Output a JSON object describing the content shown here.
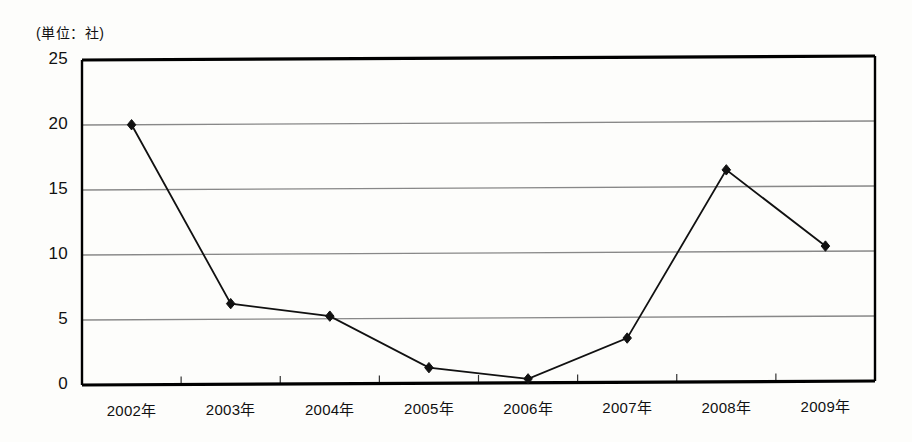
{
  "chart_data": {
    "type": "line",
    "title": "",
    "subtitle": "",
    "unit_label": "(単位：社)",
    "xlabel": "",
    "ylabel": "",
    "categories": [
      "2002年",
      "2003年",
      "2004年",
      "2005年",
      "2006年",
      "2007年",
      "2008年",
      "2009年"
    ],
    "values": [
      20.0,
      6.2,
      5.2,
      1.2,
      0.3,
      3.4,
      16.3,
      10.4
    ],
    "series": [
      {
        "name": "社数",
        "values": [
          20.0,
          6.2,
          5.2,
          1.2,
          0.3,
          3.4,
          16.3,
          10.4
        ],
        "marker": "diamond",
        "color": "#111111"
      }
    ],
    "ylim": [
      0,
      25
    ],
    "yticks": [
      0,
      5,
      10,
      15,
      20,
      25
    ],
    "ytick_labels": [
      "0",
      "5",
      "10",
      "15",
      "20",
      "25"
    ],
    "grid": "horizontal",
    "legend": "none",
    "line_color": "#111111",
    "grid_color": "#888888",
    "frame_color": "#000000"
  }
}
